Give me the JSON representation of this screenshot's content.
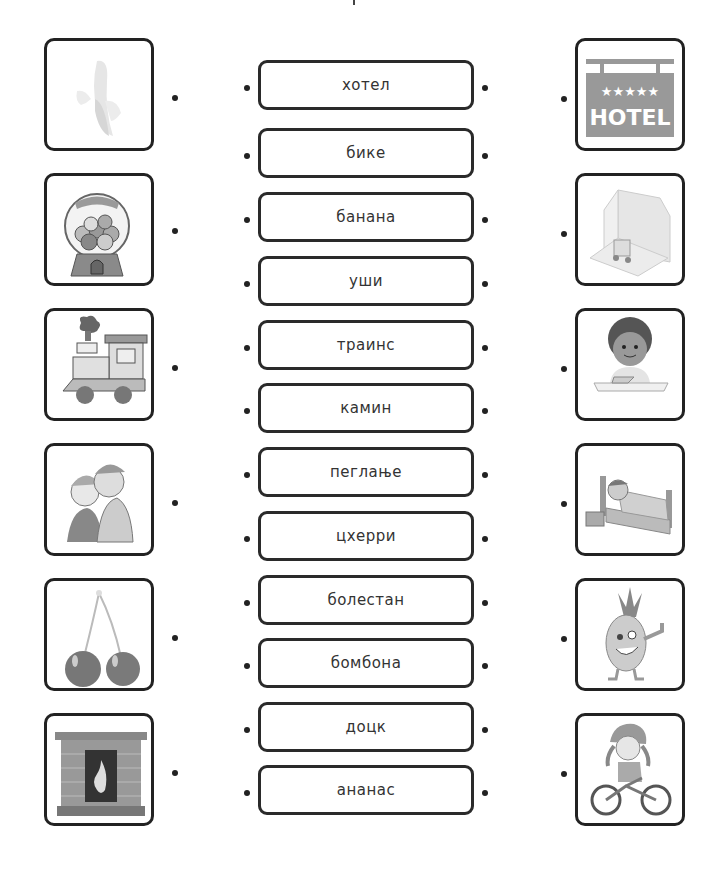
{
  "worksheet": {
    "left_pictures": [
      {
        "name": "banana",
        "icon": "banana-icon"
      },
      {
        "name": "gumball-machine",
        "icon": "candy-icon"
      },
      {
        "name": "train",
        "icon": "train-icon"
      },
      {
        "name": "whispering-ear",
        "icon": "ears-icon"
      },
      {
        "name": "cherries",
        "icon": "cherry-icon"
      },
      {
        "name": "fireplace",
        "icon": "fireplace-icon"
      }
    ],
    "words": [
      "хотел",
      "бике",
      "банана",
      "уши",
      "траинс",
      "камин",
      "пеглање",
      "цхерри",
      "болестан",
      "бомбона",
      "доцк",
      "ананас"
    ],
    "right_pictures": [
      {
        "name": "hotel-sign",
        "icon": "hotel-icon",
        "sign_text": "HOTEL",
        "stars": "★★★★★"
      },
      {
        "name": "dock-warehouse",
        "icon": "dock-icon"
      },
      {
        "name": "boy-ironing",
        "icon": "ironing-icon"
      },
      {
        "name": "sick-child-in-bed",
        "icon": "sick-icon"
      },
      {
        "name": "pineapple",
        "icon": "pineapple-icon"
      },
      {
        "name": "girl-on-bike",
        "icon": "bike-icon"
      }
    ]
  }
}
